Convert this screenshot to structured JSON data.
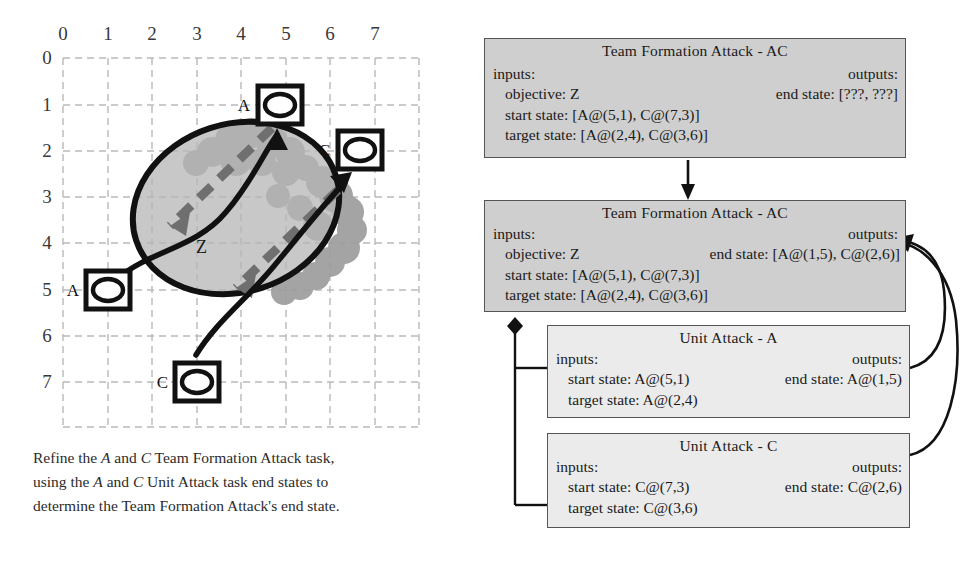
{
  "figure": {
    "caption_lines": [
      "Refine the A and C Team Formation Attack task,",
      "using the A and C Unit Attack task end states to",
      "determine the Team Formation Attack's end state."
    ],
    "caption_plain": "Refine the A and C Team Formation Attack task, using the A and C Unit Attack task end states to determine the Team Formation Attack's end state."
  },
  "grid": {
    "x_ticks": [
      "0",
      "1",
      "2",
      "3",
      "4",
      "5",
      "6",
      "7"
    ],
    "y_ticks": [
      "0",
      "1",
      "2",
      "3",
      "4",
      "5",
      "6",
      "7"
    ],
    "objective_label": "Z",
    "units": [
      {
        "label": "A",
        "x": 5,
        "y": 1,
        "role": "start",
        "symbol": "armor-unit-icon"
      },
      {
        "label": "C",
        "x": 7,
        "y": 3,
        "role": "start",
        "symbol": "armor-unit-icon"
      },
      {
        "label": "A",
        "x": 1,
        "y": 5,
        "role": "end",
        "symbol": "armor-unit-icon"
      },
      {
        "label": "C",
        "x": 3,
        "y": 7,
        "role": "end",
        "symbol": "armor-unit-icon"
      }
    ]
  },
  "boxes": [
    {
      "id": "team-formation-attack-ac-before",
      "title": "Team Formation Attack - AC",
      "inputs_label": "inputs:",
      "outputs_label": "outputs:",
      "objective": "objective: Z",
      "end_state": "end state: [???, ???]",
      "start_state": "start state: [A@(5,1), C@(7,3)]",
      "target_state": "target state: [A@(2,4), C@(3,6)]"
    },
    {
      "id": "team-formation-attack-ac-after",
      "title": "Team Formation Attack - AC",
      "inputs_label": "inputs:",
      "outputs_label": "outputs:",
      "objective": "objective: Z",
      "end_state": "end state: [A@(1,5), C@(2,6)]",
      "start_state": "start state: [A@(5,1), C@(7,3)]",
      "target_state": "target state: [A@(2,4), C@(3,6)]"
    },
    {
      "id": "unit-attack-a",
      "title": "Unit Attack - A",
      "inputs_label": "inputs:",
      "outputs_label": "outputs:",
      "start_state": "start state: A@(5,1)",
      "end_state": "end state: A@(1,5)",
      "target_state": "target state: A@(2,4)"
    },
    {
      "id": "unit-attack-c",
      "title": "Unit Attack - C",
      "inputs_label": "inputs:",
      "outputs_label": "outputs:",
      "start_state": "start state: C@(7,3)",
      "end_state": "end state: C@(2,6)",
      "target_state": "target state: C@(3,6)"
    }
  ],
  "colors": {
    "team_box_fill": "#cfcfcf",
    "unit_box_fill": "#ebebeb",
    "box_border": "#555555",
    "grid_line": "#b9b9b9",
    "objective_fill": "#b4b4b4",
    "blob_fill": "#9a9a9a",
    "ink": "#111111"
  }
}
